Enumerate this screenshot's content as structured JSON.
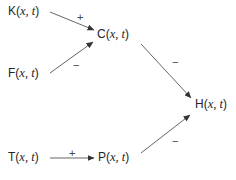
{
  "diagram": {
    "type": "signed-directed-graph",
    "nodes": [
      {
        "id": "K",
        "letter": "K",
        "open": "(",
        "args": "x, t",
        "close": ")",
        "label": "K(x, t)",
        "x": 8,
        "y": 4
      },
      {
        "id": "F",
        "letter": "F",
        "open": "(",
        "args": "x, t",
        "close": ")",
        "label": "F(x, t)",
        "x": 8,
        "y": 66
      },
      {
        "id": "C",
        "letter": "C",
        "open": "(",
        "args": "x, t",
        "close": ")",
        "label": "C(x, t)",
        "x": 97,
        "y": 27
      },
      {
        "id": "H",
        "letter": "H",
        "open": "(",
        "args": "x, t",
        "close": ")",
        "label": "H(x, t)",
        "x": 195,
        "y": 97
      },
      {
        "id": "T",
        "letter": "T",
        "open": "(",
        "args": "x, t",
        "close": ")",
        "label": "T(x, t)",
        "x": 8,
        "y": 150
      },
      {
        "id": "P",
        "letter": "P",
        "open": "(",
        "args": "x, t",
        "close": ")",
        "label": "P(x, t)",
        "x": 98,
        "y": 150
      }
    ],
    "edges": [
      {
        "from": "K",
        "to": "C",
        "sign": "+",
        "x1": 50,
        "y1": 12,
        "x2": 94,
        "y2": 30,
        "label_x": 77,
        "label_y": 11
      },
      {
        "from": "F",
        "to": "C",
        "sign": "−",
        "x1": 50,
        "y1": 73,
        "x2": 93,
        "y2": 42,
        "label_x": 73,
        "label_y": 59
      },
      {
        "from": "C",
        "to": "H",
        "sign": "−",
        "x1": 141,
        "y1": 44,
        "x2": 191,
        "y2": 98,
        "label_x": 172,
        "label_y": 56
      },
      {
        "from": "P",
        "to": "H",
        "sign": "−",
        "x1": 141,
        "y1": 153,
        "x2": 190,
        "y2": 115,
        "label_x": 172,
        "label_y": 135
      },
      {
        "from": "T",
        "to": "P",
        "sign": "+",
        "x1": 50,
        "y1": 158,
        "x2": 94,
        "y2": 158,
        "label_x": 69,
        "label_y": 147
      }
    ]
  },
  "colors": {
    "edge": "#555555",
    "text": "#262626",
    "background": "#ffffff"
  }
}
